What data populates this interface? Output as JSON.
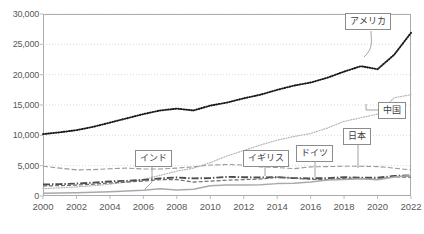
{
  "chart_data": {
    "type": "line",
    "title": "",
    "xlabel": "",
    "ylabel": "",
    "xlim": [
      2000,
      2022
    ],
    "ylim": [
      0,
      30000
    ],
    "grid": true,
    "legend": "annotations",
    "x": [
      2000,
      2001,
      2002,
      2003,
      2004,
      2005,
      2006,
      2007,
      2008,
      2009,
      2010,
      2011,
      2012,
      2013,
      2014,
      2015,
      2016,
      2017,
      2018,
      2019,
      2020,
      2021,
      2022
    ],
    "yticks": [
      "0",
      "5,000",
      "10,000",
      "15,000",
      "20,000",
      "25,000",
      "30,000"
    ],
    "ytick_values": [
      0,
      5000,
      10000,
      15000,
      20000,
      25000,
      30000
    ],
    "xticks": [
      "2000",
      "2002",
      "2004",
      "2006",
      "2008",
      "2010",
      "2012",
      "2014",
      "2016",
      "2018",
      "2020",
      "2022"
    ],
    "xtick_values": [
      2000,
      2002,
      2004,
      2006,
      2008,
      2010,
      2012,
      2014,
      2016,
      2018,
      2020,
      2022
    ],
    "series": [
      {
        "name": "アメリカ",
        "label": "アメリカ",
        "style": "dotted-bold",
        "color": "#1a1a1a",
        "values": [
          10200,
          10500,
          10850,
          11400,
          12100,
          12800,
          13500,
          14100,
          14400,
          14100,
          14900,
          15400,
          16100,
          16700,
          17500,
          18200,
          18700,
          19500,
          20500,
          21400,
          20900,
          23300,
          26900
        ]
      },
      {
        "name": "中国",
        "label": "中国",
        "style": "dotted-light",
        "color": "#b5b5b5",
        "values": [
          1200,
          1350,
          1500,
          1700,
          1950,
          2300,
          2750,
          3400,
          4100,
          4600,
          5500,
          6600,
          7500,
          8400,
          9200,
          9800,
          10300,
          11200,
          12300,
          12900,
          13500,
          16200,
          16700
        ]
      },
      {
        "name": "日本",
        "label": "日本",
        "style": "dashed-light",
        "color": "#9a9a9a",
        "values": [
          4900,
          4600,
          4300,
          4350,
          4500,
          4600,
          4450,
          4450,
          4600,
          4800,
          5100,
          5200,
          5100,
          4800,
          4700,
          4500,
          4800,
          4850,
          4900,
          4900,
          4850,
          4600,
          4300
        ]
      },
      {
        "name": "ドイツ",
        "label": "ドイツ",
        "style": "dashdot",
        "color": "#4d4d4d",
        "values": [
          1900,
          1950,
          2050,
          2200,
          2400,
          2500,
          2650,
          2900,
          3050,
          2900,
          2950,
          3150,
          3100,
          3050,
          3100,
          2950,
          2900,
          2950,
          3100,
          3000,
          3000,
          3300,
          3400
        ]
      },
      {
        "name": "イギリス",
        "label": "イギリス",
        "style": "dashed-mid",
        "color": "#6b6b6b",
        "values": [
          1650,
          1700,
          1800,
          1950,
          2150,
          2300,
          2450,
          2700,
          2700,
          2300,
          2450,
          2600,
          2700,
          2800,
          3100,
          2950,
          2750,
          2700,
          2900,
          2900,
          2750,
          3150,
          3100
        ]
      },
      {
        "name": "インド",
        "label": "インド",
        "style": "solid-light",
        "color": "#a9a9a9",
        "values": [
          470,
          490,
          520,
          610,
          720,
          820,
          940,
          1200,
          1000,
          1100,
          1680,
          1820,
          1830,
          1860,
          2040,
          2100,
          2290,
          2650,
          2710,
          2840,
          2670,
          3150,
          3390
        ]
      }
    ],
    "annotations": [
      {
        "label": "アメリカ",
        "points_to_series": "アメリカ"
      },
      {
        "label": "中国",
        "points_to_series": "中国"
      },
      {
        "label": "日本",
        "points_to_series": "日本"
      },
      {
        "label": "ドイツ",
        "points_to_series": "ドイツ"
      },
      {
        "label": "イギリス",
        "points_to_series": "イギリス"
      },
      {
        "label": "インド",
        "points_to_series": "インド"
      }
    ]
  }
}
